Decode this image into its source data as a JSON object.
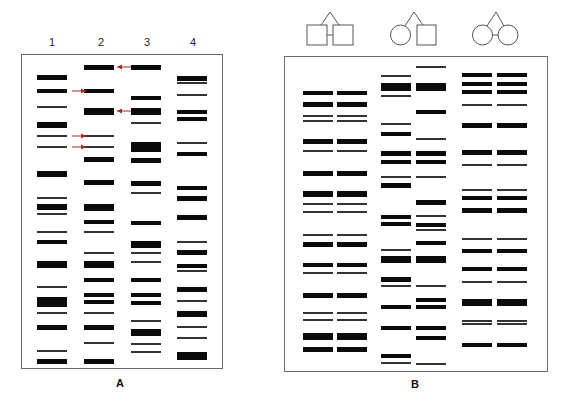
{
  "figure": {
    "panel_a": {
      "label": "A",
      "lane_labels": [
        "1",
        "2",
        "3",
        "4"
      ],
      "box": {
        "x": 21,
        "y": 54,
        "w": 202,
        "h": 315
      },
      "lanes": [
        {
          "x": 37,
          "w": 30,
          "bands": [
            [
              77,
              5
            ],
            [
              91,
              4
            ],
            [
              107,
              1.6
            ],
            [
              125,
              6
            ],
            [
              136,
              1.6
            ],
            [
              147,
              1.6
            ],
            [
              174,
              6
            ],
            [
              198,
              1.6
            ],
            [
              207,
              6
            ],
            [
              214,
              1.6
            ],
            [
              232,
              1.6
            ],
            [
              242,
              4
            ],
            [
              264,
              7
            ],
            [
              287,
              1.6
            ],
            [
              302,
              10
            ],
            [
              313,
              1.6
            ],
            [
              327,
              5
            ],
            [
              351,
              1.6
            ],
            [
              361,
              5
            ]
          ]
        },
        {
          "x": 84,
          "w": 30,
          "bands": [
            [
              67,
              5
            ],
            [
              91,
              4
            ],
            [
              111,
              7
            ],
            [
              136,
              1.6
            ],
            [
              147,
              1.6
            ],
            [
              159,
              5
            ],
            [
              182,
              5
            ],
            [
              207,
              7
            ],
            [
              222,
              4
            ],
            [
              232,
              1.6
            ],
            [
              253,
              1.6
            ],
            [
              264,
              7
            ],
            [
              280,
              4
            ],
            [
              295,
              4
            ],
            [
              302,
              4
            ],
            [
              313,
              1.6
            ],
            [
              327,
              5
            ],
            [
              343,
              1.6
            ],
            [
              361,
              5
            ]
          ]
        },
        {
          "x": 131,
          "w": 30,
          "bands": [
            [
              67,
              5
            ],
            [
              98,
              4
            ],
            [
              111,
              7
            ],
            [
              123,
              1.6
            ],
            [
              147,
              10
            ],
            [
              160,
              5
            ],
            [
              183,
              5
            ],
            [
              193,
              1.6
            ],
            [
              223,
              4
            ],
            [
              244,
              7
            ],
            [
              253,
              1.6
            ],
            [
              262,
              1.6
            ],
            [
              280,
              4
            ],
            [
              295,
              4
            ],
            [
              303,
              4
            ],
            [
              321,
              1.6
            ],
            [
              332,
              7
            ],
            [
              344,
              1.6
            ],
            [
              352,
              1.6
            ]
          ]
        },
        {
          "x": 177,
          "w": 30,
          "bands": [
            [
              78,
              5
            ],
            [
              83,
              1.6
            ],
            [
              95,
              1.6
            ],
            [
              112,
              4
            ],
            [
              119,
              4
            ],
            [
              143,
              1.6
            ],
            [
              154,
              4
            ],
            [
              188,
              4
            ],
            [
              198,
              5
            ],
            [
              217,
              5
            ],
            [
              242,
              1.6
            ],
            [
              252,
              5
            ],
            [
              266,
              4
            ],
            [
              271,
              1.6
            ],
            [
              289,
              5
            ],
            [
              301,
              1.6
            ],
            [
              314,
              6
            ],
            [
              327,
              1.6
            ],
            [
              338,
              1.6
            ],
            [
              356,
              8
            ]
          ]
        }
      ],
      "arrows": [
        {
          "y": 67,
          "from_x": 131,
          "to_x": 117,
          "direction": "left"
        },
        {
          "y": 91,
          "from_x": 72,
          "to_x": 86,
          "direction": "right"
        },
        {
          "y": 111,
          "from_x": 131,
          "to_x": 117,
          "direction": "left"
        },
        {
          "y": 136,
          "from_x": 72,
          "to_x": 86,
          "direction": "right"
        },
        {
          "y": 147,
          "from_x": 72,
          "to_x": 86,
          "direction": "right"
        }
      ],
      "arrow_color": "#a0302a"
    },
    "panel_b": {
      "label": "B",
      "box": {
        "x": 284,
        "y": 56,
        "w": 264,
        "h": 316
      },
      "pedigrees": [
        {
          "type": "male-male-twins",
          "apex": [
            330,
            12
          ]
        },
        {
          "type": "female-male-twins",
          "apex": [
            414,
            12
          ]
        },
        {
          "type": "female-female-twins",
          "apex": [
            496,
            12
          ]
        }
      ],
      "columns": [
        {
          "x": 303,
          "w": 30,
          "bands": [
            [
              93,
              4
            ],
            [
              104,
              5
            ],
            [
              116,
              1.6
            ],
            [
              121,
              1.6
            ],
            [
              141,
              5
            ],
            [
              151,
              1.6
            ],
            [
              173,
              5
            ],
            [
              194,
              6
            ],
            [
              204,
              1.6
            ],
            [
              212,
              1.6
            ],
            [
              235,
              1.6
            ],
            [
              244,
              5
            ],
            [
              265,
              4
            ],
            [
              273,
              1.6
            ],
            [
              295,
              5
            ],
            [
              313,
              1.6
            ],
            [
              320,
              1.6
            ],
            [
              336,
              7
            ],
            [
              349,
              5
            ]
          ]
        },
        {
          "x": 337,
          "w": 30,
          "bands": [
            [
              93,
              4
            ],
            [
              104,
              5
            ],
            [
              116,
              1.6
            ],
            [
              121,
              1.6
            ],
            [
              141,
              5
            ],
            [
              151,
              1.6
            ],
            [
              173,
              5
            ],
            [
              194,
              6
            ],
            [
              204,
              1.6
            ],
            [
              212,
              1.6
            ],
            [
              235,
              1.6
            ],
            [
              244,
              5
            ],
            [
              265,
              4
            ],
            [
              273,
              1.6
            ],
            [
              295,
              5
            ],
            [
              313,
              1.6
            ],
            [
              320,
              1.6
            ],
            [
              336,
              7
            ],
            [
              349,
              5
            ]
          ]
        },
        {
          "x": 381,
          "w": 30,
          "bands": [
            [
              76,
              1.6
            ],
            [
              87,
              8
            ],
            [
              96,
              1.6
            ],
            [
              124,
              1.6
            ],
            [
              134,
              4
            ],
            [
              153,
              5
            ],
            [
              162,
              4
            ],
            [
              177,
              1.6
            ],
            [
              185,
              5
            ],
            [
              217,
              4
            ],
            [
              224,
              4
            ],
            [
              250,
              1.6
            ],
            [
              259,
              7
            ],
            [
              279,
              5
            ],
            [
              286,
              1.6
            ],
            [
              307,
              4
            ],
            [
              328,
              4
            ],
            [
              356,
              4
            ],
            [
              363,
              1.6
            ]
          ]
        },
        {
          "x": 416,
          "w": 30,
          "bands": [
            [
              67,
              1.6
            ],
            [
              87,
              8
            ],
            [
              112,
              4
            ],
            [
              139,
              1.6
            ],
            [
              153,
              5
            ],
            [
              162,
              4
            ],
            [
              177,
              1.6
            ],
            [
              202,
              5
            ],
            [
              216,
              1.6
            ],
            [
              225,
              4
            ],
            [
              230,
              1.6
            ],
            [
              243,
              4
            ],
            [
              259,
              7
            ],
            [
              286,
              1.6
            ],
            [
              300,
              4
            ],
            [
              307,
              4
            ],
            [
              328,
              4
            ],
            [
              338,
              4
            ],
            [
              364,
              1.6
            ]
          ]
        },
        {
          "x": 462,
          "w": 30,
          "bands": [
            [
              75,
              4
            ],
            [
              84,
              4
            ],
            [
              92,
              4
            ],
            [
              105,
              1.6
            ],
            [
              125,
              5
            ],
            [
              152,
              5
            ],
            [
              165,
              1.6
            ],
            [
              190,
              1.6
            ],
            [
              198,
              4
            ],
            [
              210,
              5
            ],
            [
              239,
              1.6
            ],
            [
              251,
              4
            ],
            [
              269,
              4
            ],
            [
              282,
              1.6
            ],
            [
              302,
              7
            ],
            [
              321,
              1.6
            ],
            [
              324,
              1.6
            ],
            [
              345,
              4
            ]
          ]
        },
        {
          "x": 497,
          "w": 30,
          "bands": [
            [
              75,
              4
            ],
            [
              84,
              4
            ],
            [
              92,
              4
            ],
            [
              105,
              1.6
            ],
            [
              125,
              5
            ],
            [
              152,
              5
            ],
            [
              165,
              1.6
            ],
            [
              190,
              1.6
            ],
            [
              198,
              4
            ],
            [
              210,
              5
            ],
            [
              239,
              1.6
            ],
            [
              251,
              4
            ],
            [
              269,
              4
            ],
            [
              282,
              1.6
            ],
            [
              302,
              7
            ],
            [
              321,
              1.6
            ],
            [
              324,
              1.6
            ],
            [
              345,
              4
            ]
          ]
        }
      ]
    }
  }
}
